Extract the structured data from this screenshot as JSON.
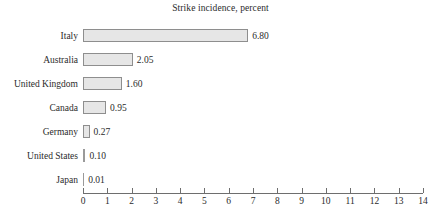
{
  "chart_data": {
    "type": "bar",
    "orientation": "horizontal",
    "title": "Strike incidence, percent",
    "xlabel": "",
    "ylabel": "",
    "categories": [
      "Italy",
      "Australia",
      "United Kingdom",
      "Canada",
      "Germany",
      "United States",
      "Japan"
    ],
    "values": [
      6.8,
      2.05,
      1.6,
      0.95,
      0.27,
      0.1,
      0.01
    ],
    "value_labels": [
      "6.80",
      "2.05",
      "1.60",
      "0.95",
      "0.27",
      "0.10",
      "0.01"
    ],
    "xlim": [
      0,
      14
    ],
    "xticks": [
      0,
      1,
      2,
      3,
      4,
      5,
      6,
      7,
      8,
      9,
      10,
      11,
      12,
      13,
      14
    ],
    "xtick_labels": [
      "0",
      "1",
      "2",
      "3",
      "4",
      "5",
      "6",
      "7",
      "8",
      "9",
      "10",
      "11",
      "12",
      "13",
      "14"
    ],
    "grid": false,
    "legend": false,
    "colors": {
      "bar_fill": "#e6e6e6",
      "bar_stroke": "#8e8e8e",
      "axis": "#6e6e6e",
      "text": "#2b2b2b",
      "background": "#ffffff"
    }
  }
}
